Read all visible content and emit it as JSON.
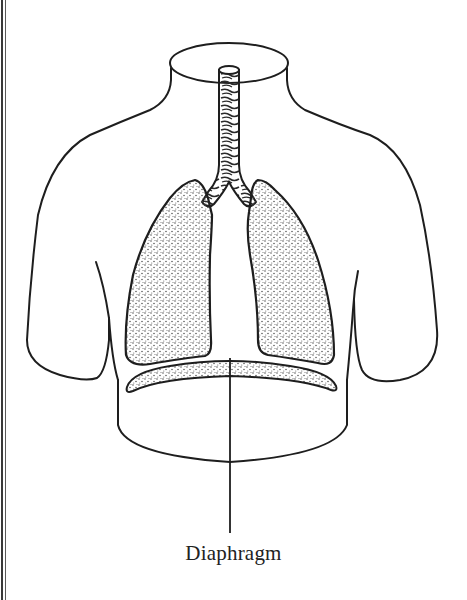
{
  "figure": {
    "type": "anatomical-diagram",
    "parts": [
      {
        "id": "neck",
        "name": "Neck"
      },
      {
        "id": "trachea",
        "name": "Trachea"
      },
      {
        "id": "bronchi",
        "name": "Bronchi"
      },
      {
        "id": "left-lung",
        "name": "Left lung"
      },
      {
        "id": "right-lung",
        "name": "Right lung"
      },
      {
        "id": "diaphragm",
        "name": "Diaphragm"
      }
    ],
    "labels": [
      {
        "text": "Diaphragm",
        "points_to": "diaphragm"
      }
    ]
  },
  "colors": {
    "line": "#1e1e1e",
    "stipple": "#4a4a4a",
    "background": "#ffffff"
  }
}
